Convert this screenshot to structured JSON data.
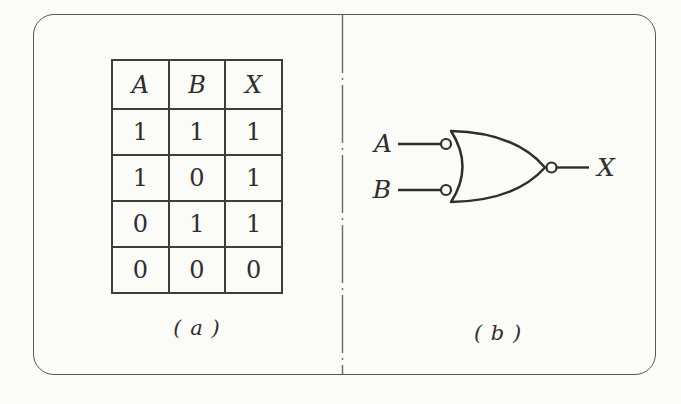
{
  "figure": {
    "panel_a": {
      "caption": "( a )",
      "truth_table": {
        "headers": [
          "A",
          "B",
          "X"
        ],
        "rows": [
          [
            "1",
            "1",
            "1"
          ],
          [
            "1",
            "0",
            "1"
          ],
          [
            "0",
            "1",
            "1"
          ],
          [
            "0",
            "0",
            "0"
          ]
        ]
      }
    },
    "panel_b": {
      "caption": "( b )",
      "input_a_label": "A",
      "input_b_label": "B",
      "output_label": "X",
      "gate_type": "or-gate-with-input-bubbles-and-output-bubble"
    },
    "colors": {
      "ink": "#2e2e2e",
      "table_line": "#3d3d3d",
      "frame": "#565656",
      "divider": "#6a6a6a",
      "paper": "#fbfbf8"
    }
  }
}
